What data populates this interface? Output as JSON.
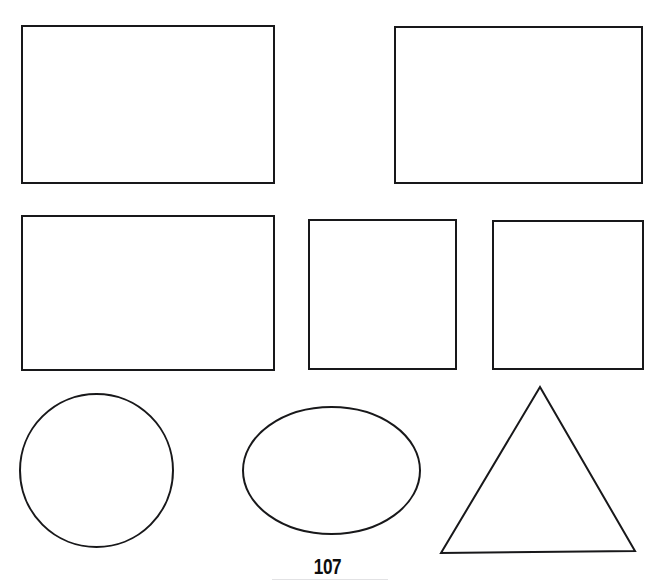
{
  "page": {
    "background_color": "#ffffff",
    "width": 655,
    "height": 585,
    "clipped_header_text": "",
    "stroke_color": "#18181a",
    "rule_color": "#e2e2e4"
  },
  "footer": {
    "page_number": "107"
  },
  "figures": {
    "caption": "",
    "rows": [
      {
        "row_label": "row-1-rectangles",
        "shapes": [
          {
            "name": "rectangle-wide-left",
            "type": "rectangle",
            "x": 22,
            "y": 26,
            "width": 252,
            "height": 157
          },
          {
            "name": "rectangle-wide-right",
            "type": "rectangle",
            "x": 395,
            "y": 27,
            "width": 247,
            "height": 156
          }
        ]
      },
      {
        "row_label": "row-2-rectangle-and-squares",
        "shapes": [
          {
            "name": "rectangle-wide-row2",
            "type": "rectangle",
            "x": 22,
            "y": 216,
            "width": 252,
            "height": 154
          },
          {
            "name": "square-middle",
            "type": "square",
            "x": 309,
            "y": 220,
            "width": 147,
            "height": 149
          },
          {
            "name": "square-right",
            "type": "square",
            "x": 493,
            "y": 221,
            "width": 150,
            "height": 148
          }
        ]
      },
      {
        "row_label": "row-3-curves-and-triangle",
        "shapes": [
          {
            "name": "circle",
            "type": "circle",
            "cx": 96.5,
            "cy": 470.5,
            "r": 76.5
          },
          {
            "name": "ellipse",
            "type": "ellipse",
            "cx": 331.5,
            "cy": 470.5,
            "rx": 88.5,
            "ry": 63.5
          },
          {
            "name": "triangle",
            "type": "triangle",
            "points": "540,387 635,551 441,553"
          }
        ]
      }
    ]
  }
}
